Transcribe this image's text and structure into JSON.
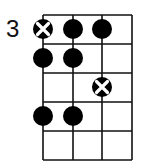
{
  "diagram": {
    "type": "chord-diagram",
    "start_fret_label": "3",
    "strings": 4,
    "frets": 5,
    "colors": {
      "line": "#111111",
      "dot": "#000000",
      "x_mark": "#ffffff",
      "background": "#ffffff"
    },
    "dots": [
      {
        "string": 1,
        "fret": 1,
        "marker": "x-dot"
      },
      {
        "string": 2,
        "fret": 1,
        "marker": "dot"
      },
      {
        "string": 3,
        "fret": 1,
        "marker": "dot"
      },
      {
        "string": 1,
        "fret": 2,
        "marker": "dot"
      },
      {
        "string": 2,
        "fret": 2,
        "marker": "dot"
      },
      {
        "string": 3,
        "fret": 3,
        "marker": "x-dot"
      },
      {
        "string": 1,
        "fret": 4,
        "marker": "dot"
      },
      {
        "string": 2,
        "fret": 4,
        "marker": "dot"
      }
    ]
  }
}
